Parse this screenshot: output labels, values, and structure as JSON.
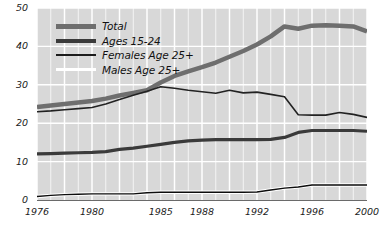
{
  "chart_data": {
    "type": "line",
    "title": "",
    "xlabel": "",
    "ylabel": "",
    "xlim": [
      1976,
      2000
    ],
    "ylim": [
      0,
      50
    ],
    "yticks": [
      0,
      10,
      20,
      30,
      40,
      50
    ],
    "xticks": [
      1976,
      1980,
      1985,
      1988,
      1992,
      1996,
      2000
    ],
    "xtick_labels": [
      "1976",
      "1980",
      "1985",
      "1988",
      "1992",
      "1996",
      "2000"
    ],
    "ytick_labels": [
      "0",
      "10",
      "20",
      "30",
      "40",
      "50"
    ],
    "grid": true,
    "grid_color": "#ffffff",
    "plot_background": "#d8d8d8",
    "legend_position": "top-left",
    "x": [
      1976,
      1977,
      1978,
      1979,
      1980,
      1981,
      1982,
      1983,
      1984,
      1985,
      1986,
      1987,
      1988,
      1989,
      1990,
      1991,
      1992,
      1993,
      1994,
      1995,
      1996,
      1997,
      1998,
      1999,
      2000
    ],
    "series": [
      {
        "name": "Total",
        "color": "#6e6e6e",
        "width": 4.5,
        "values": [
          24.2,
          24.6,
          25.0,
          25.4,
          25.8,
          26.4,
          27.2,
          27.9,
          28.6,
          30.6,
          32.3,
          33.5,
          34.6,
          35.8,
          37.3,
          38.8,
          40.5,
          42.6,
          45.2,
          44.6,
          45.4,
          45.5,
          45.4,
          45.2,
          43.9
        ]
      },
      {
        "name": "Ages 15-24",
        "color": "#3a3a3a",
        "width": 3.2,
        "values": [
          12.0,
          12.1,
          12.2,
          12.3,
          12.4,
          12.6,
          13.2,
          13.5,
          14.0,
          14.5,
          15.0,
          15.4,
          15.6,
          15.7,
          15.7,
          15.7,
          15.7,
          15.8,
          16.3,
          17.6,
          18.1,
          18.1,
          18.1,
          18.1,
          17.9
        ]
      },
      {
        "name": "Females Age 25+",
        "color": "#222222",
        "width": 1.6,
        "values": [
          23.0,
          23.2,
          23.5,
          23.8,
          24.1,
          25.0,
          26.2,
          27.3,
          28.3,
          29.5,
          29.1,
          28.6,
          28.2,
          27.8,
          28.6,
          27.9,
          28.1,
          27.5,
          26.9,
          22.2,
          22.1,
          22.1,
          22.8,
          22.3,
          21.5
        ]
      },
      {
        "name": "Males Age 25+",
        "color": "#0d0d0d",
        "width": 1.4,
        "values": [
          0.9,
          1.2,
          1.4,
          1.5,
          1.6,
          1.6,
          1.6,
          1.6,
          1.9,
          2.0,
          2.0,
          2.0,
          2.0,
          2.0,
          2.0,
          2.0,
          2.1,
          2.6,
          3.1,
          3.4,
          3.9,
          3.9,
          3.9,
          3.9,
          3.9
        ]
      }
    ],
    "legend": [
      {
        "label": "Total",
        "swatch": "thick-gray"
      },
      {
        "label": "Ages 15-24",
        "swatch": "medium-dark"
      },
      {
        "label": "Females Age 25+",
        "swatch": "thin-dark"
      },
      {
        "label": "Males Age 25+",
        "swatch": "thin-white"
      }
    ]
  },
  "top_clipped_text": ""
}
